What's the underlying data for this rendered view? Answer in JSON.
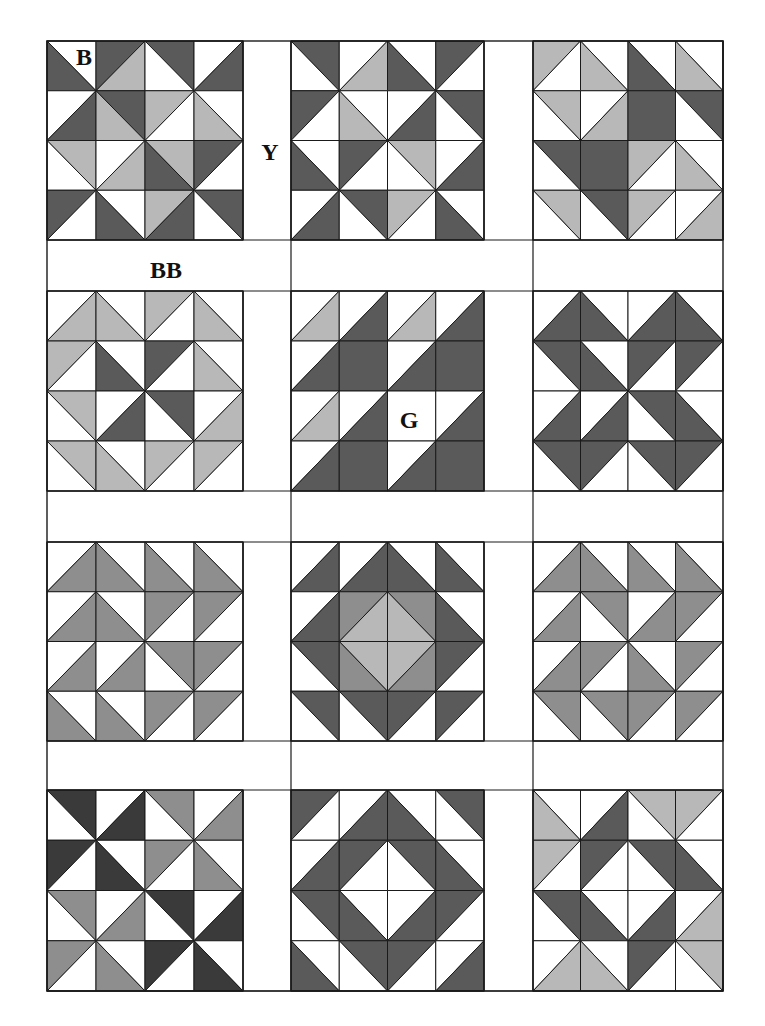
{
  "figure": {
    "type": "quilt-layout-diagram",
    "labels": [
      {
        "id": "B",
        "text": "B",
        "x": 84,
        "y": 57
      },
      {
        "id": "Y",
        "text": "Y",
        "x": 270,
        "y": 152
      },
      {
        "id": "BB",
        "text": "BB",
        "x": 166,
        "y": 270
      },
      {
        "id": "G",
        "text": "G",
        "x": 409,
        "y": 420
      }
    ]
  },
  "palette": {
    "W": "#ffffff",
    "L": "#b8b8b8",
    "M": "#8e8e8e",
    "D": "#5a5a5a",
    "K": "#3a3a3a",
    "line": "#1a1a1a"
  },
  "layout": {
    "outer": {
      "x": 47,
      "y": 41,
      "w": 676,
      "h": 950
    },
    "col_x": [
      47,
      291,
      533
    ],
    "col_block_w": [
      196,
      193,
      190
    ],
    "col_right": [
      291,
      533,
      723
    ],
    "row_y": [
      41,
      291,
      542,
      790
    ],
    "row_block_h": [
      199,
      200,
      199,
      201
    ],
    "row_bottom": [
      291,
      542,
      790,
      991
    ]
  },
  "cell_legend": {
    "b": "diagonal from top-left to bottom-right; colors = [upper-right, lower-left]",
    "f": "diagonal from bottom-left to top-right; colors = [upper-left, lower-right]",
    "s": "solid square"
  },
  "blocks": [
    {
      "name": "block-r1-c1",
      "row": 0,
      "col": 0,
      "cells": [
        [
          "bWD",
          "fDL",
          "bDW",
          "fWD"
        ],
        [
          "fWD",
          "bDL",
          "fLW",
          "bWL"
        ],
        [
          "bLW",
          "fWL",
          "bLD",
          "fDW"
        ],
        [
          "fDW",
          "bWD",
          "fLD",
          "bDW"
        ]
      ]
    },
    {
      "name": "block-r1-c2",
      "row": 0,
      "col": 1,
      "cells": [
        [
          "bDW",
          "fWL",
          "bWD",
          "fDW"
        ],
        [
          "fDW",
          "bWL",
          "fWD",
          "bDW"
        ],
        [
          "bWD",
          "fDW",
          "bLW",
          "fWD"
        ],
        [
          "fWD",
          "bDW",
          "fLW",
          "bWD"
        ]
      ]
    },
    {
      "name": "block-r1-c3",
      "row": 0,
      "col": 2,
      "cells": [
        [
          "fLW",
          "bWL",
          "bWD",
          "bWL"
        ],
        [
          "bLW",
          "fWL",
          "sDD",
          "bDW"
        ],
        [
          "bDW",
          "sDD",
          "fLW",
          "bWL"
        ],
        [
          "bLW",
          "bDW",
          "fLW",
          "fWL"
        ]
      ]
    },
    {
      "name": "block-r2-c1",
      "row": 1,
      "col": 0,
      "cells": [
        [
          "fWL",
          "bWL",
          "fLW",
          "bWL"
        ],
        [
          "fLW",
          "bWD",
          "fDW",
          "bWL"
        ],
        [
          "bLW",
          "fWD",
          "bDW",
          "fWL"
        ],
        [
          "bLW",
          "bWL",
          "fLW",
          "fLW"
        ]
      ]
    },
    {
      "name": "block-r2-c2",
      "row": 1,
      "col": 1,
      "cells": [
        [
          "fWL",
          "fWD",
          "fWL",
          "fWD"
        ],
        [
          "fWD",
          "sDD",
          "fWD",
          "sDD"
        ],
        [
          "fWL",
          "fWD",
          "sWW",
          "fWD"
        ],
        [
          "fWD",
          "sDD",
          "fWD",
          "sDD"
        ]
      ]
    },
    {
      "name": "block-r2-c3",
      "row": 1,
      "col": 2,
      "cells": [
        [
          "fWD",
          "bWD",
          "fWD",
          "bWD"
        ],
        [
          "bDW",
          "bWD",
          "fDW",
          "fDW"
        ],
        [
          "fWD",
          "fWD",
          "bDW",
          "bWD"
        ],
        [
          "bDW",
          "fDW",
          "bDW",
          "fDW"
        ]
      ]
    },
    {
      "name": "block-r3-c1",
      "row": 2,
      "col": 0,
      "cells": [
        [
          "fWM",
          "bWM",
          "bWM",
          "bWM"
        ],
        [
          "fWM",
          "bWM",
          "fMW",
          "fMW"
        ],
        [
          "fWM",
          "fWM",
          "bMW",
          "fMW"
        ],
        [
          "bWM",
          "bWM",
          "fMW",
          "fMW"
        ]
      ]
    },
    {
      "name": "block-r3-c2",
      "row": 2,
      "col": 1,
      "cells": [
        [
          "fWD",
          "fWD",
          "bWD",
          "bWD"
        ],
        [
          "fWD",
          "fML",
          "bML",
          "bWD"
        ],
        [
          "bDW",
          "bLM",
          "fLM",
          "fDW"
        ],
        [
          "bDW",
          "bDW",
          "fDW",
          "fDW"
        ]
      ]
    },
    {
      "name": "block-r3-c3",
      "row": 2,
      "col": 2,
      "cells": [
        [
          "fWM",
          "bWM",
          "bWM",
          "bWM"
        ],
        [
          "fWM",
          "bMW",
          "fWM",
          "fMW"
        ],
        [
          "fWM",
          "fMW",
          "bWM",
          "fMW"
        ],
        [
          "bMW",
          "bMW",
          "fMW",
          "fMW"
        ]
      ]
    },
    {
      "name": "block-r4-c1",
      "row": 3,
      "col": 0,
      "cells": [
        [
          "bKW",
          "fWK",
          "bMW",
          "fWM"
        ],
        [
          "fKW",
          "bWK",
          "fMW",
          "bWM"
        ],
        [
          "bMW",
          "fWM",
          "bKW",
          "fWK"
        ],
        [
          "fMW",
          "bWM",
          "fKW",
          "bWK"
        ]
      ]
    },
    {
      "name": "block-r4-c2",
      "row": 3,
      "col": 1,
      "cells": [
        [
          "fDW",
          "fWD",
          "bWD",
          "bDW"
        ],
        [
          "fWD",
          "fDW",
          "bDW",
          "bWD"
        ],
        [
          "bDW",
          "bWD",
          "fWD",
          "fDW"
        ],
        [
          "bWD",
          "bDW",
          "fDW",
          "fWD"
        ]
      ]
    },
    {
      "name": "block-r4-c3",
      "row": 3,
      "col": 2,
      "cells": [
        [
          "bWL",
          "fWD",
          "bLW",
          "fLW"
        ],
        [
          "fLW",
          "fDW",
          "bDW",
          "bWD"
        ],
        [
          "bDW",
          "bWD",
          "fWD",
          "fWL"
        ],
        [
          "fWL",
          "bWL",
          "fDW",
          "bLW"
        ]
      ]
    }
  ]
}
